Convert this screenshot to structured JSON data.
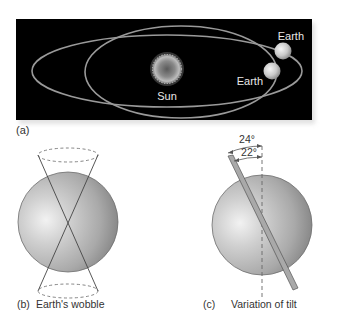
{
  "panel_a": {
    "label": "(a)",
    "sun_label": "Sun",
    "earth_label_top": "Earth",
    "earth_label_bottom": "Earth",
    "background_color": "#000000",
    "orbit_color": "#9a9a9a"
  },
  "panel_b": {
    "label": "(b)",
    "caption": "Earth's wobble"
  },
  "panel_c": {
    "label": "(c)",
    "caption": "Variation of tilt",
    "angle_outer": "24°",
    "angle_inner": "22°"
  }
}
